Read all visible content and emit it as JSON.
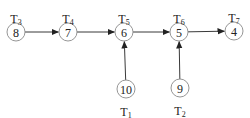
{
  "diagram": {
    "type": "directed-graph",
    "nodes": [
      {
        "id": "T3",
        "value": "8",
        "label": "T",
        "sub": "3",
        "cx": 16,
        "cy": 32,
        "label_pos": "above"
      },
      {
        "id": "T4",
        "value": "7",
        "label": "T",
        "sub": "4",
        "cx": 68,
        "cy": 32,
        "label_pos": "above"
      },
      {
        "id": "T5",
        "value": "6",
        "label": "T",
        "sub": "5",
        "cx": 124,
        "cy": 32,
        "label_pos": "above"
      },
      {
        "id": "T6",
        "value": "5",
        "label": "T",
        "sub": "6",
        "cx": 179,
        "cy": 32,
        "label_pos": "above"
      },
      {
        "id": "T7",
        "value": "4",
        "label": "T",
        "sub": "7",
        "cx": 234,
        "cy": 31,
        "label_pos": "above"
      },
      {
        "id": "T1",
        "value": "10",
        "label": "T",
        "sub": "1",
        "cx": 126,
        "cy": 89,
        "label_pos": "below"
      },
      {
        "id": "T2",
        "value": "9",
        "label": "T",
        "sub": "2",
        "cx": 180,
        "cy": 88,
        "label_pos": "below"
      }
    ],
    "edges": [
      {
        "from": "T3",
        "to": "T4"
      },
      {
        "from": "T4",
        "to": "T5"
      },
      {
        "from": "T5",
        "to": "T6"
      },
      {
        "from": "T6",
        "to": "T7"
      },
      {
        "from": "T1",
        "to": "T5"
      },
      {
        "from": "T2",
        "to": "T6"
      }
    ],
    "node_radius": 9,
    "colors": {
      "stroke": "#8a8a8a",
      "edge": "#222222",
      "text": "#222222"
    }
  }
}
